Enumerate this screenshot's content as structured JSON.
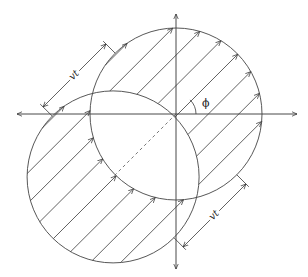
{
  "figure": {
    "type": "geometric diagram",
    "labels": {
      "displacement_upper": "vt",
      "displacement_lower": "vt",
      "angle": "ϕ"
    },
    "colors": {
      "stroke": "#3a3a3a",
      "background": "#ffffff"
    },
    "geometry": {
      "origin": [
        176,
        114
      ],
      "radius": 86,
      "displacement": 89,
      "direction_deg": 45,
      "hatch_offsets": [
        -84.6,
        -63.1,
        -41.6,
        -20.1,
        1.4,
        22.9,
        44.4,
        65.9
      ],
      "axis_x": [
        17,
        297
      ],
      "axis_y": [
        14,
        269
      ],
      "dimension_offset": 13,
      "angle_arc_radius": 20
    }
  }
}
